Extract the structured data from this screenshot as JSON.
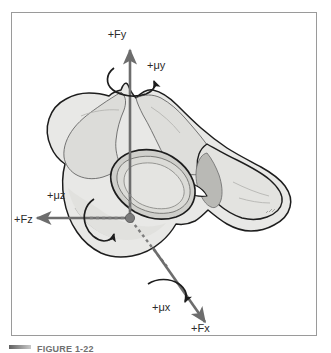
{
  "figure": {
    "title_caption": "FIGURE 1-22",
    "caption_marker": "caption-rule",
    "frame": {
      "border_color": "#9a9a9a",
      "background_color": "#ffffff"
    },
    "colors": {
      "arrow": "#6d6d6d",
      "bone_outline": "#1d1d1d",
      "bone_fill_light": "#e8e8e6",
      "bone_fill_mid": "#d6d6d3",
      "bone_fill_dark": "#b9b9b5",
      "origin_dot": "#7a7a7a",
      "label_text": "#2b2b2b"
    },
    "origin": {
      "label": "origin-dot",
      "x": 130,
      "y": 218
    },
    "axes": [
      {
        "id": "fy",
        "force_label": "+Fy",
        "moment_label": "+μy",
        "direction": "up",
        "axis_name": "y-axis",
        "force_label_x": 117,
        "force_label_y": 34,
        "moment_label_x": 147,
        "moment_label_y": 65
      },
      {
        "id": "fz",
        "force_label": "+Fz",
        "moment_label": "+μz",
        "direction": "left",
        "axis_name": "z-axis",
        "force_label_x": 14,
        "force_label_y": 222,
        "moment_label_x": 47,
        "moment_label_y": 198
      },
      {
        "id": "fx",
        "force_label": "+Fx",
        "moment_label": "+μx",
        "direction": "down-right",
        "axis_name": "x-axis",
        "force_label_x": 191,
        "force_label_y": 329,
        "moment_label_x": 156,
        "moment_label_y": 308
      }
    ]
  }
}
